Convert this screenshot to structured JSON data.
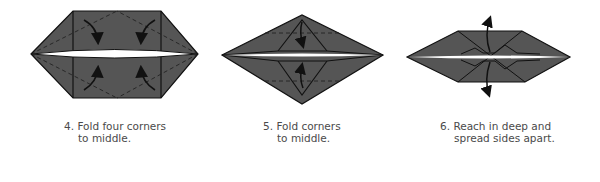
{
  "figure": {
    "type": "origami-instructions",
    "colors": {
      "paper": "#555555",
      "edge": "#111111",
      "gap": "#ffffff",
      "text": "#4a4a4a"
    },
    "steps": [
      {
        "number": "4.",
        "line1": "Fold four corners",
        "line2": "to middle.",
        "arrows": [
          "curved-arrow-in",
          "curved-arrow-in",
          "curved-arrow-in",
          "curved-arrow-in"
        ]
      },
      {
        "number": "5.",
        "line1": "Fold corners",
        "line2": "to middle.",
        "arrows": [
          "curved-arrow-down",
          "curved-arrow-up"
        ]
      },
      {
        "number": "6.",
        "line1": "Reach in deep and",
        "line2": "spread sides apart.",
        "arrows": [
          "curved-arrow-up",
          "curved-arrow-down"
        ]
      }
    ]
  }
}
